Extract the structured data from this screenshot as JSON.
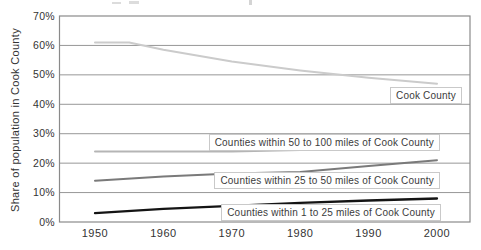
{
  "figure": {
    "y_axis_title": "Share of population in Cook County"
  },
  "chart_data": {
    "type": "line",
    "title": "",
    "xlabel": "",
    "ylabel": "Share of population in Cook County",
    "ylim": [
      0,
      70
    ],
    "xlim": [
      1950,
      2005
    ],
    "grid": "horizontal",
    "legend_position": "inline-labels",
    "y_tick_labels": [
      "0%",
      "10%",
      "20%",
      "30%",
      "40%",
      "50%",
      "60%",
      "70%"
    ],
    "x_ticks": [
      "1950",
      "1960",
      "1970",
      "1980",
      "1990",
      "2000"
    ],
    "series": [
      {
        "key": "cook-county",
        "name": "Cook County",
        "color": "#cbcbcb",
        "stroke_width": 2,
        "points": [
          [
            1950,
            61
          ],
          [
            1955,
            61
          ],
          [
            1960,
            58.5
          ],
          [
            1970,
            54.5
          ],
          [
            1980,
            51.5
          ],
          [
            1990,
            49
          ],
          [
            2000,
            47
          ]
        ]
      },
      {
        "key": "counties-50-100-miles",
        "name": "Counties within 50 to 100 miles of Cook County",
        "color": "#b5b5b5",
        "stroke_width": 2,
        "points": [
          [
            1950,
            24
          ],
          [
            1960,
            24
          ],
          [
            1970,
            24
          ],
          [
            1980,
            24.5
          ],
          [
            1990,
            24.5
          ],
          [
            2000,
            25
          ]
        ]
      },
      {
        "key": "counties-25-50-miles",
        "name": "Counties within 25 to 50 miles of Cook County",
        "color": "#7a7a7a",
        "stroke_width": 2,
        "points": [
          [
            1950,
            14
          ],
          [
            1960,
            15.5
          ],
          [
            1970,
            16.5
          ],
          [
            1980,
            17
          ],
          [
            1990,
            19
          ],
          [
            2000,
            21
          ]
        ]
      },
      {
        "key": "counties-1-25-miles",
        "name": "Counties within 1 to 25 miles of Cook County",
        "color": "#141414",
        "stroke_width": 2.3,
        "points": [
          [
            1950,
            3
          ],
          [
            1960,
            4.5
          ],
          [
            1970,
            5.5
          ],
          [
            1980,
            6.5
          ],
          [
            1990,
            7.3
          ],
          [
            2000,
            8
          ]
        ]
      }
    ]
  },
  "colors": {
    "gridline": "#979797",
    "plot_border": "#8a8a8a",
    "text": "#3a3a3a",
    "background": "#ffffff"
  }
}
